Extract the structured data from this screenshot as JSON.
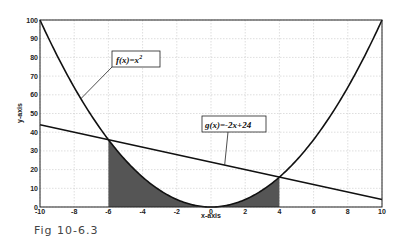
{
  "chart_data": {
    "type": "line",
    "title": "",
    "xlabel": "x-axis",
    "ylabel": "y-axis",
    "xlim": [
      -10,
      10
    ],
    "ylim": [
      0,
      100
    ],
    "grid": true,
    "x_ticks": [
      -10,
      -8,
      -6,
      -4,
      -2,
      0,
      2,
      4,
      6,
      8,
      10
    ],
    "y_ticks": [
      0,
      10,
      20,
      30,
      40,
      50,
      60,
      70,
      80,
      90,
      100
    ],
    "series": [
      {
        "name": "f(x)=x^2",
        "function": "x^2",
        "x": [
          -10,
          -8,
          -6,
          -4,
          -2,
          0,
          2,
          4,
          6,
          8,
          10
        ],
        "values": [
          100,
          64,
          36,
          16,
          4,
          0,
          4,
          16,
          36,
          64,
          100
        ]
      },
      {
        "name": "g(x)=-2x+24",
        "function": "-2x+24",
        "x": [
          -10,
          -6,
          0,
          4,
          10
        ],
        "values": [
          44,
          36,
          24,
          16,
          4
        ]
      }
    ],
    "shaded_regions": [
      {
        "description": "area under f(x) from x=-6 to x=4",
        "from": -6,
        "to": 4,
        "under": "f(x)=x^2",
        "color": "#555555"
      }
    ],
    "intersections": [
      {
        "x": -6,
        "y": 36
      },
      {
        "x": 4,
        "y": 16
      }
    ],
    "annotations": [
      {
        "text": "f(x)=x",
        "superscript": "2",
        "arrow_to": {
          "x": -7.6,
          "y": 58
        }
      },
      {
        "text": "g(x)=-2x+24",
        "arrow_to": {
          "x": 0.8,
          "y": 22.5
        }
      }
    ]
  },
  "labels": {
    "xlabel": "x-axis",
    "ylabel": "y-axis",
    "f_label": "f(x)=x",
    "f_sup": "2",
    "g_label": "g(x)=-2x+24",
    "caption": "Fig 10-6.3"
  },
  "colors": {
    "curve": "#111111",
    "fill": "#555555",
    "grid": "#c8c8c8",
    "axis": "#222222"
  }
}
